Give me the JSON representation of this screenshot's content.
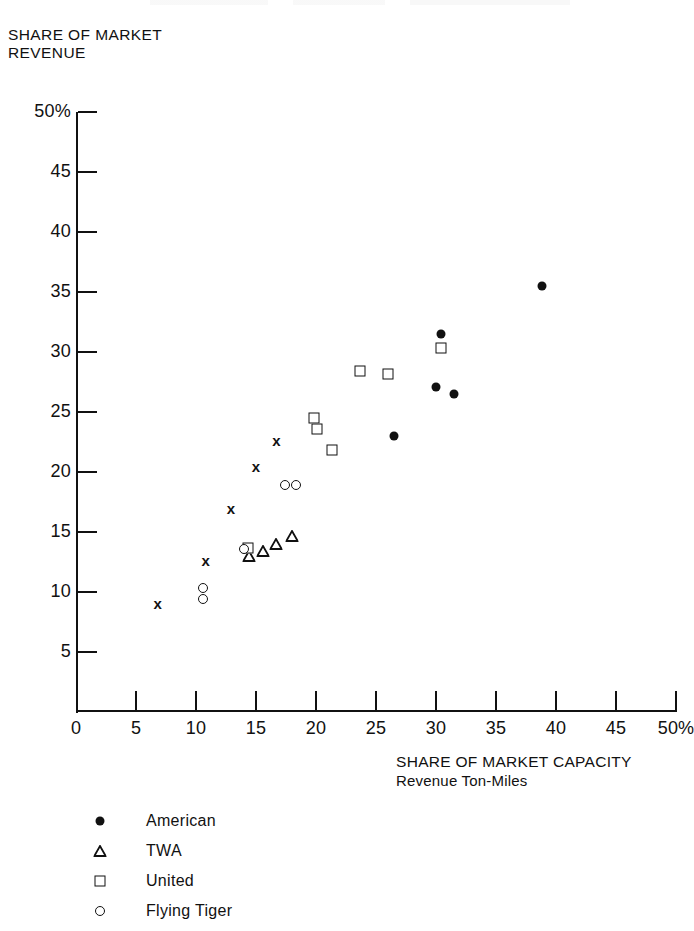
{
  "chart_data": {
    "type": "scatter",
    "title": "",
    "xlabel": "SHARE OF MARKET CAPACITY",
    "xlabel_sub": "Revenue Ton-Miles",
    "ylabel": "SHARE OF MARKET\nREVENUE",
    "xlim": [
      0,
      50
    ],
    "ylim": [
      0,
      50
    ],
    "xticks": [
      "0",
      "5",
      "10",
      "15",
      "20",
      "25",
      "30",
      "35",
      "40",
      "45",
      "50%"
    ],
    "xtick_values": [
      0,
      5,
      10,
      15,
      20,
      25,
      30,
      35,
      40,
      45,
      50
    ],
    "yticks": [
      "5",
      "10",
      "15",
      "20",
      "25",
      "30",
      "35",
      "40",
      "45",
      "50%"
    ],
    "ytick_values": [
      5,
      10,
      15,
      20,
      25,
      30,
      35,
      40,
      45,
      50
    ],
    "grid": false,
    "legend_position": "below-left",
    "series": [
      {
        "name": "American",
        "marker": "filled-circle",
        "color": "#111111",
        "points": [
          {
            "x": 26.5,
            "y": 23.0
          },
          {
            "x": 30.4,
            "y": 31.5
          },
          {
            "x": 30.0,
            "y": 27.1
          },
          {
            "x": 31.5,
            "y": 26.5
          },
          {
            "x": 38.8,
            "y": 35.5
          }
        ]
      },
      {
        "name": "TWA",
        "marker": "open-triangle",
        "color": "#111111",
        "points": [
          {
            "x": 14.4,
            "y": 13.0
          },
          {
            "x": 15.6,
            "y": 13.4
          },
          {
            "x": 16.7,
            "y": 14.0
          },
          {
            "x": 18.0,
            "y": 14.7
          }
        ]
      },
      {
        "name": "United",
        "marker": "open-square",
        "color": "#111111",
        "points": [
          {
            "x": 14.3,
            "y": 13.7
          },
          {
            "x": 19.8,
            "y": 24.5
          },
          {
            "x": 20.1,
            "y": 23.6
          },
          {
            "x": 21.3,
            "y": 21.8
          },
          {
            "x": 23.7,
            "y": 28.4
          },
          {
            "x": 26.0,
            "y": 28.2
          },
          {
            "x": 30.4,
            "y": 30.3
          }
        ]
      },
      {
        "name": "Flying Tiger",
        "marker": "open-circle",
        "color": "#111111",
        "points": [
          {
            "x": 10.6,
            "y": 10.3
          },
          {
            "x": 10.6,
            "y": 9.4
          },
          {
            "x": 14.0,
            "y": 13.6
          },
          {
            "x": 17.4,
            "y": 18.9
          },
          {
            "x": 18.3,
            "y": 18.9
          }
        ]
      },
      {
        "name": "",
        "marker": "cross",
        "color": "#111111",
        "points": [
          {
            "x": 6.8,
            "y": 9.1
          },
          {
            "x": 10.8,
            "y": 12.7
          },
          {
            "x": 12.9,
            "y": 17.0
          },
          {
            "x": 15.0,
            "y": 20.5
          },
          {
            "x": 16.7,
            "y": 22.7
          }
        ]
      }
    ]
  },
  "legend": {
    "items": [
      {
        "label": "American",
        "marker": "filled-circle"
      },
      {
        "label": "TWA",
        "marker": "open-triangle"
      },
      {
        "label": "United",
        "marker": "open-square"
      },
      {
        "label": "Flying Tiger",
        "marker": "open-circle"
      }
    ]
  }
}
